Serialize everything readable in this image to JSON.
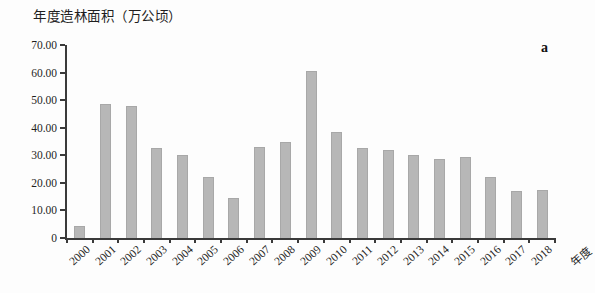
{
  "annotation": "a",
  "chart_data": {
    "type": "bar",
    "title": "年度造林面积（万公顷）",
    "xlabel": "年度",
    "ylabel": "",
    "categories": [
      "2000",
      "2001",
      "2002",
      "2003",
      "2004",
      "2005",
      "2006",
      "2007",
      "2008",
      "2009",
      "2010",
      "2011",
      "2012",
      "2013",
      "2014",
      "2015",
      "2016",
      "2017",
      "2018"
    ],
    "values": [
      4.5,
      48.5,
      48,
      32.5,
      30,
      22,
      14.5,
      33,
      35,
      60.5,
      38.5,
      32.5,
      32,
      30,
      28.5,
      29.5,
      22,
      17,
      17.5
    ],
    "ylim": [
      0,
      70
    ],
    "ytick_values": [
      0,
      10,
      20,
      30,
      40,
      50,
      60,
      70
    ],
    "ytick_labels": [
      "0",
      "10.00",
      "20.00",
      "30.00",
      "40.00",
      "50.00",
      "60.00",
      "70.00"
    ],
    "grid": false,
    "legend_position": "none",
    "bar_color": "#b7b7b7",
    "bar_border_color": "#a8a8a8",
    "axis_color": "#3a3a3a",
    "text_color": "#1f1f1f"
  }
}
